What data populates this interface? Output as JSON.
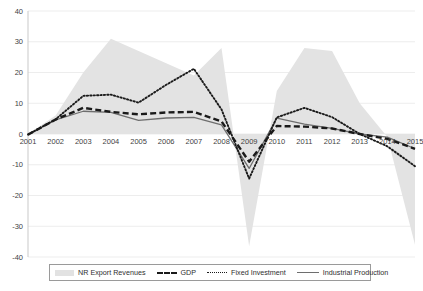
{
  "chart_data": {
    "type": "area",
    "title": "",
    "xlabel": "",
    "ylabel": "",
    "grid": true,
    "legend_position": "bottom",
    "ylim": [
      -40,
      40
    ],
    "yticks": [
      "40",
      "30",
      "20",
      "10",
      "0",
      "-10",
      "-20",
      "-30",
      "-40"
    ],
    "ytick_values": [
      40,
      30,
      20,
      10,
      0,
      -10,
      -20,
      -30,
      -40
    ],
    "categories": [
      "2001",
      "2002",
      "2003",
      "2004",
      "2005",
      "2006",
      "2007",
      "2008",
      "2009",
      "2010",
      "2011",
      "2012",
      "2013",
      "2014",
      "2015"
    ],
    "series": [
      {
        "name": "NR Export Revenues",
        "style": "area",
        "color": "#e3e3e3",
        "values": [
          0,
          6,
          20,
          31,
          27,
          23,
          19,
          28,
          -36.5,
          14,
          28,
          27,
          10,
          -1,
          -36
        ]
      },
      {
        "name": "GDP",
        "style": "dashed",
        "color": "#1a1a1a",
        "values": [
          -0.2,
          4.7,
          8.5,
          7.2,
          6.4,
          7.0,
          7.2,
          4.1,
          -9.0,
          2.6,
          2.4,
          1.8,
          0.0,
          -1.6,
          -4.8
        ]
      },
      {
        "name": "Fixed Investment",
        "style": "dotted",
        "color": "#1a1a1a",
        "values": [
          -0.2,
          4.8,
          12.4,
          12.8,
          10.2,
          16.0,
          21.2,
          8.0,
          -14.5,
          5.4,
          8.5,
          5.5,
          0.0,
          -4.0,
          -10.5
        ]
      },
      {
        "name": "Industrial Production",
        "style": "solid",
        "color": "#6e6e6e",
        "values": [
          -0.2,
          4.6,
          7.4,
          7.0,
          4.4,
          5.2,
          5.4,
          3.0,
          -11.2,
          5.2,
          3.2,
          1.8,
          0.0,
          -1.0,
          -4.8
        ]
      }
    ]
  },
  "legend": {
    "items": [
      {
        "label": "NR Export Revenues",
        "swatch": "area-swatch"
      },
      {
        "label": "GDP",
        "swatch": "dashed-line-swatch"
      },
      {
        "label": "Fixed Investment",
        "swatch": "dotted-line-swatch"
      },
      {
        "label": "Industrial Production",
        "swatch": "solid-line-swatch"
      }
    ]
  },
  "axes": {
    "y_tick_labels": [
      "40",
      "30",
      "20",
      "10",
      "0",
      "-10",
      "-20",
      "-30",
      "-40"
    ],
    "x_tick_labels": [
      "2001",
      "2002",
      "2003",
      "2004",
      "2005",
      "2006",
      "2007",
      "2008",
      "2009",
      "2010",
      "2011",
      "2012",
      "2013",
      "2014",
      "2015"
    ]
  }
}
